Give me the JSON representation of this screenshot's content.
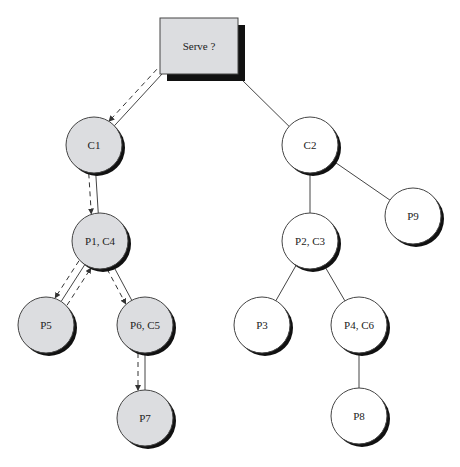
{
  "diagram": {
    "colors": {
      "visited_fill": "#dcdde0",
      "unvisited_fill": "#ffffff",
      "stroke": "#444444",
      "shadow": "#111111",
      "box_fill": "#dcdde0"
    },
    "root": {
      "id": "root",
      "label": "Serve ?",
      "x": 160,
      "y": 18,
      "w": 78,
      "h": 56
    },
    "nodes": [
      {
        "id": "C1",
        "label": "C1",
        "cx": 94,
        "cy": 145,
        "visited": true
      },
      {
        "id": "P1C4",
        "label": "P1, C4",
        "cx": 100,
        "cy": 241,
        "visited": true
      },
      {
        "id": "P5",
        "label": "P5",
        "cx": 46,
        "cy": 325,
        "visited": true
      },
      {
        "id": "P6C5",
        "label": "P6, C5",
        "cx": 145,
        "cy": 325,
        "visited": true
      },
      {
        "id": "P7",
        "label": "P7",
        "cx": 145,
        "cy": 418,
        "visited": true
      },
      {
        "id": "C2",
        "label": "C2",
        "cx": 310,
        "cy": 145,
        "visited": false
      },
      {
        "id": "P2C3",
        "label": "P2, C3",
        "cx": 310,
        "cy": 241,
        "visited": false
      },
      {
        "id": "P9",
        "label": "P9",
        "cx": 413,
        "cy": 216,
        "visited": false
      },
      {
        "id": "P3",
        "label": "P3",
        "cx": 262,
        "cy": 325,
        "visited": false
      },
      {
        "id": "P4C6",
        "label": "P4, C6",
        "cx": 359,
        "cy": 325,
        "visited": false
      },
      {
        "id": "P8",
        "label": "P8",
        "cx": 359,
        "cy": 416,
        "visited": false
      }
    ],
    "edges": [
      {
        "from": "root",
        "to": "C1"
      },
      {
        "from": "root",
        "to": "C2"
      },
      {
        "from": "C1",
        "to": "P1C4"
      },
      {
        "from": "P1C4",
        "to": "P5"
      },
      {
        "from": "P1C4",
        "to": "P6C5"
      },
      {
        "from": "P6C5",
        "to": "P7"
      },
      {
        "from": "C2",
        "to": "P2C3"
      },
      {
        "from": "C2",
        "to": "P9"
      },
      {
        "from": "P2C3",
        "to": "P3"
      },
      {
        "from": "P2C3",
        "to": "P4C6"
      },
      {
        "from": "P4C6",
        "to": "P8"
      }
    ],
    "search_path": [
      {
        "from": "root",
        "to": "C1"
      },
      {
        "from": "C1",
        "to": "P1C4"
      },
      {
        "from": "P1C4",
        "to": "P5"
      },
      {
        "from": "P5",
        "to": "P1C4"
      },
      {
        "from": "P1C4",
        "to": "P6C5"
      },
      {
        "from": "P6C5",
        "to": "P7"
      }
    ]
  }
}
